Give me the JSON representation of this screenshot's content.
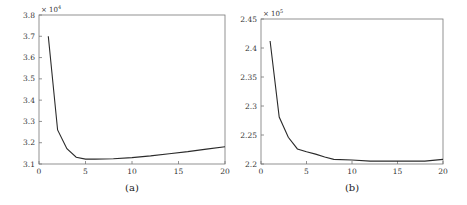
{
  "chart_data": [
    {
      "type": "line",
      "caption": "(a)",
      "title": "",
      "xlabel": "",
      "ylabel": "",
      "y_multiplier": {
        "base": "× 10",
        "exponent": "4"
      },
      "xlim": [
        0,
        20
      ],
      "ylim": [
        3.1,
        3.8
      ],
      "x_ticks": [
        0,
        5,
        10,
        15,
        20
      ],
      "x_tick_labels": [
        "0",
        "5",
        "10",
        "15",
        "20"
      ],
      "y_ticks": [
        3.1,
        3.2,
        3.3,
        3.4,
        3.5,
        3.6,
        3.7,
        3.8
      ],
      "y_tick_labels": [
        "3.1",
        "3.2",
        "3.3",
        "3.4",
        "3.5",
        "3.6",
        "3.7",
        "3.8"
      ],
      "grid": false,
      "series": [
        {
          "name": "curve",
          "x": [
            1,
            2,
            3,
            4,
            5,
            6,
            8,
            10,
            12,
            14,
            16,
            18,
            20
          ],
          "y": [
            3.7,
            3.26,
            3.172,
            3.132,
            3.123,
            3.123,
            3.125,
            3.13,
            3.138,
            3.148,
            3.158,
            3.17,
            3.181
          ]
        }
      ]
    },
    {
      "type": "line",
      "caption": "(b)",
      "title": "",
      "xlabel": "",
      "ylabel": "",
      "y_multiplier": {
        "base": "× 10",
        "exponent": "5"
      },
      "xlim": [
        0,
        20
      ],
      "ylim": [
        2.2,
        2.45
      ],
      "x_ticks": [
        0,
        5,
        10,
        15,
        20
      ],
      "x_tick_labels": [
        "0",
        "5",
        "10",
        "15",
        "20"
      ],
      "y_ticks": [
        2.2,
        2.25,
        2.3,
        2.35,
        2.4,
        2.45
      ],
      "y_tick_labels": [
        "2.2",
        "2.25",
        "2.3",
        "2.35",
        "2.4",
        "2.45"
      ],
      "grid": false,
      "series": [
        {
          "name": "curve",
          "x": [
            1,
            2,
            3,
            4,
            5,
            6,
            7,
            8,
            10,
            12,
            14,
            16,
            18,
            20
          ],
          "y": [
            2.412,
            2.281,
            2.246,
            2.226,
            2.221,
            2.217,
            2.212,
            2.208,
            2.207,
            2.205,
            2.205,
            2.205,
            2.205,
            2.208
          ]
        }
      ]
    }
  ]
}
